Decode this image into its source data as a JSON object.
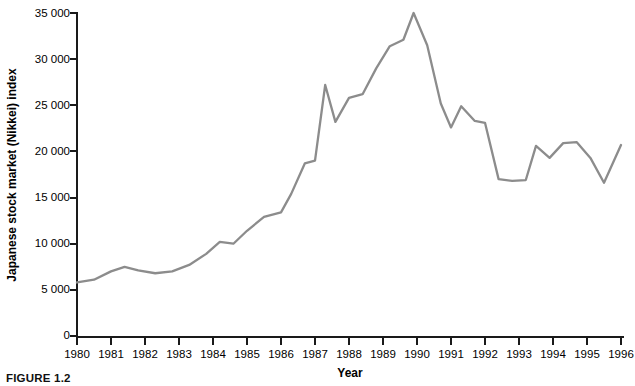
{
  "figure": {
    "caption": "FIGURE 1.2"
  },
  "chart_data": {
    "type": "line",
    "title": "",
    "xlabel": "Year",
    "ylabel": "Japanese stock market (Nikkei) index",
    "xlim": [
      1980,
      1996
    ],
    "ylim": [
      0,
      35000
    ],
    "grid": false,
    "legend": null,
    "line_color": "#8c8c8c",
    "axis_color": "#1a1a1a",
    "y_ticks": [
      0,
      5000,
      10000,
      15000,
      20000,
      25000,
      30000,
      35000
    ],
    "y_tick_labels": [
      "0",
      "5 000",
      "10 000",
      "15 000",
      "20 000",
      "25 000",
      "30 000",
      "35 000"
    ],
    "x_ticks": [
      1980,
      1981,
      1982,
      1983,
      1984,
      1985,
      1986,
      1987,
      1988,
      1989,
      1990,
      1991,
      1992,
      1993,
      1994,
      1995,
      1996
    ],
    "x_tick_labels": [
      "1980",
      "1981",
      "1982",
      "1983",
      "1984",
      "1985",
      "1986",
      "1987",
      "1988",
      "1989",
      "1990",
      "1991",
      "1992",
      "1993",
      "1994",
      "1995",
      "1996"
    ],
    "x": [
      1980.0,
      1980.5,
      1981.0,
      1981.4,
      1981.8,
      1982.3,
      1982.8,
      1983.3,
      1983.8,
      1984.2,
      1984.6,
      1985.0,
      1985.5,
      1986.0,
      1986.3,
      1986.7,
      1987.0,
      1987.3,
      1987.6,
      1988.0,
      1988.4,
      1988.8,
      1989.2,
      1989.6,
      1989.9,
      1990.3,
      1990.7,
      1991.0,
      1991.3,
      1991.7,
      1992.0,
      1992.4,
      1992.8,
      1993.2,
      1993.5,
      1993.9,
      1994.3,
      1994.7,
      1995.1,
      1995.5,
      1996.0
    ],
    "y": [
      5800,
      6100,
      7000,
      7500,
      7100,
      6800,
      7000,
      7700,
      8900,
      10200,
      10000,
      11400,
      12900,
      13400,
      15400,
      18700,
      19000,
      27200,
      23200,
      25800,
      26200,
      29000,
      31400,
      32100,
      35000,
      31500,
      25200,
      22600,
      24900,
      23300,
      23100,
      17000,
      16800,
      16900,
      20600,
      19300,
      20900,
      21000,
      19300,
      16600,
      20700
    ],
    "annotations": []
  }
}
